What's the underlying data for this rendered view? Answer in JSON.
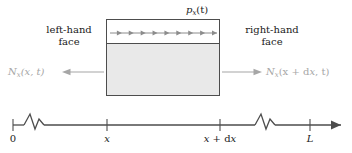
{
  "figure": {
    "title_label": "p_x(t)",
    "background_color": "#ffffff",
    "box_fill_color": "#e9e9e9",
    "box_stroke_color": "#4d4d4d",
    "gray_text_color": "#a6a6a6",
    "dark_text_color": "#1a1a1a",
    "arrow_color": "#808080"
  },
  "labels": {
    "pressure": "p",
    "pressure_sub": "x",
    "pressure_arg": "(t)",
    "left_face_line1": "left-hand",
    "left_face_line2": "face",
    "right_face_line1": "right-hand",
    "right_face_line2": "face",
    "flux_left": "N",
    "flux_left_sub": "x",
    "flux_left_arg": "(x, t)",
    "flux_right": "N",
    "flux_right_sub": "x",
    "flux_right_arg_a": "(x + d",
    "flux_right_arg_b": "x",
    "flux_right_arg_c": ", t)"
  },
  "axis": {
    "ticks": [
      {
        "label": "0",
        "italic": false
      },
      {
        "label": "x",
        "italic": true
      },
      {
        "label": "x + dx",
        "italic": true
      },
      {
        "label": "L",
        "italic": true
      }
    ],
    "tick_x_positions": [
      13,
      107,
      220,
      310
    ],
    "break_x_positions": [
      34,
      265
    ],
    "y": 125,
    "start_x": 13,
    "end_x": 341
  },
  "interior_arrows": {
    "count": 9,
    "start_x": 110,
    "end_x": 217,
    "y": 33
  }
}
